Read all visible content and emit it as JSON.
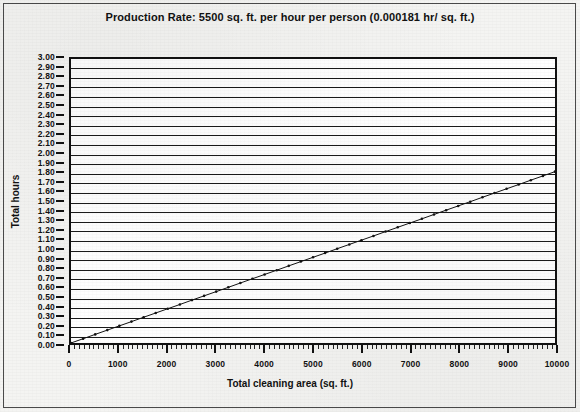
{
  "chart_data": {
    "type": "line",
    "title": "Production Rate: 5500 sq. ft. per hour per person (0.000181 hr/ sq. ft.)",
    "xlabel": "Total cleaning area (sq. ft.)",
    "ylabel": "Total hours",
    "xlim": [
      0,
      10000
    ],
    "ylim": [
      0,
      3.0
    ],
    "grid": "horizontal",
    "legend": "none",
    "slope_hours_per_sqft": 0.000181,
    "x_major_step": 1000,
    "x_minor_step": 100,
    "y_major_step": 0.1,
    "x_ticklabels": [
      "0",
      "1000",
      "2000",
      "3000",
      "4000",
      "5000",
      "6000",
      "7000",
      "8000",
      "9000",
      "10000"
    ],
    "x_tickvalues": [
      0,
      1000,
      2000,
      3000,
      4000,
      5000,
      6000,
      7000,
      8000,
      9000,
      10000
    ],
    "y_ticklabels": [
      "3.00",
      "2.90",
      "2.80",
      "2.70",
      "2.60",
      "2.50",
      "2.40",
      "2.30",
      "2.20",
      "2.10",
      "2.00",
      "1.90",
      "1.80",
      "1.70",
      "1.60",
      "1.50",
      "1.40",
      "1.30",
      "1.20",
      "1.10",
      "1.00",
      "0.90",
      "0.80",
      "0.70",
      "0.60",
      "0.50",
      "0.40",
      "0.30",
      "0.20",
      "0.10",
      "0.00"
    ],
    "y_tickvalues": [
      3.0,
      2.9,
      2.8,
      2.7,
      2.6,
      2.5,
      2.4,
      2.3,
      2.2,
      2.1,
      2.0,
      1.9,
      1.8,
      1.7,
      1.6,
      1.5,
      1.4,
      1.3,
      1.2,
      1.1,
      1.0,
      0.9,
      0.8,
      0.7,
      0.6,
      0.5,
      0.4,
      0.3,
      0.2,
      0.1,
      0.0
    ],
    "series": [
      {
        "name": "Total hours",
        "x": [
          0,
          250,
          500,
          750,
          1000,
          1250,
          1500,
          1750,
          2000,
          2250,
          2500,
          2750,
          3000,
          3250,
          3500,
          3750,
          4000,
          4250,
          4500,
          4750,
          5000,
          5250,
          5500,
          5750,
          6000,
          6250,
          6500,
          6750,
          7000,
          7250,
          7500,
          7750,
          8000,
          8250,
          8500,
          8750,
          9000,
          9250,
          9500,
          9750,
          10000
        ],
        "values": [
          0.0,
          0.045,
          0.091,
          0.136,
          0.181,
          0.226,
          0.272,
          0.317,
          0.362,
          0.407,
          0.453,
          0.498,
          0.543,
          0.588,
          0.634,
          0.679,
          0.724,
          0.769,
          0.815,
          0.86,
          0.905,
          0.95,
          0.996,
          1.041,
          1.086,
          1.131,
          1.177,
          1.222,
          1.267,
          1.312,
          1.358,
          1.403,
          1.448,
          1.493,
          1.539,
          1.584,
          1.629,
          1.674,
          1.72,
          1.765,
          1.81
        ],
        "color": "#111111",
        "marker": "dot",
        "linewidth": 1
      }
    ]
  },
  "colors": {
    "page_background": "#f4f4f2",
    "plot_background": "#ffffff",
    "ink": "#111111",
    "frame": "#4a4a4a"
  }
}
